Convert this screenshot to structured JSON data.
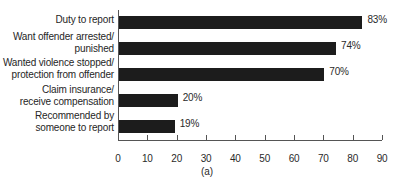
{
  "chart_data": {
    "type": "bar",
    "orientation": "horizontal",
    "title": "",
    "subtitle": "",
    "xlabel": "",
    "ylabel": "",
    "xlim": [
      0,
      90
    ],
    "xticks": [
      0,
      10,
      20,
      30,
      40,
      50,
      60,
      70,
      80,
      90
    ],
    "xtick_labels": [
      "0",
      "10",
      "20",
      "30",
      "40",
      "50",
      "60",
      "70",
      "80",
      "90"
    ],
    "grid": false,
    "legend": null,
    "categories": [
      "Duty to report",
      "Want offender arrested/ punished",
      "Wanted violence stopped/ protection from offender",
      "Claim insurance/ receive compensation",
      "Recommended by someone to report"
    ],
    "values": [
      83,
      74,
      70,
      20,
      19
    ],
    "value_labels": [
      "83%",
      "74%",
      "70%",
      "20%",
      "19%"
    ],
    "bar_color": "#1c1c1c",
    "axis_color": "#555555",
    "text_color": "#262626"
  },
  "labels": {
    "line_0_a": "Duty to report",
    "line_0_b": "",
    "line_1_a": "Want offender arrested/",
    "line_1_b": "punished",
    "line_2_a": "Wanted violence stopped/",
    "line_2_b": "protection from offender",
    "line_3_a": "Claim insurance/",
    "line_3_b": "receive compensation",
    "line_4_a": "Recommended by",
    "line_4_b": "someone to report"
  },
  "caption": "(a)"
}
